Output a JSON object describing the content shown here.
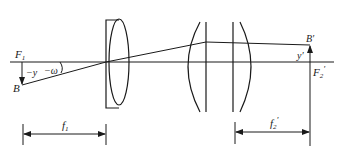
{
  "diagram": {
    "type": "optical-system-schematic",
    "colors": {
      "line": "#1a1a1a",
      "background": "#ffffff"
    },
    "labels": {
      "F1": "F",
      "F1_sub": "1",
      "B": "B",
      "minus_y": "−y",
      "minus_omega": "−ω",
      "B_prime": "B′",
      "y_prime": "y′",
      "F2_prime": "F",
      "F2_prime_sub": "2",
      "F2_prime_mark": "′",
      "f1": "f",
      "f1_sub": "1",
      "f2_prime": "f",
      "f2_prime_sub": "2",
      "f2_prime_mark": "′"
    },
    "elements": [
      {
        "name": "optical-axis"
      },
      {
        "name": "object-arrow",
        "from": "F1",
        "to": "B"
      },
      {
        "name": "lens-1",
        "description": "plano-convex lens in rectangular mount"
      },
      {
        "name": "lens-group-2",
        "description": "pair of converging arcs with two vertical element lines"
      },
      {
        "name": "image-arrow",
        "from": "F2'",
        "to": "B'"
      },
      {
        "name": "chief-ray",
        "path": [
          "B",
          "lens-1 center",
          "lens-group-2",
          "B'"
        ]
      },
      {
        "name": "dimension-f1"
      },
      {
        "name": "dimension-f2-prime"
      }
    ]
  }
}
